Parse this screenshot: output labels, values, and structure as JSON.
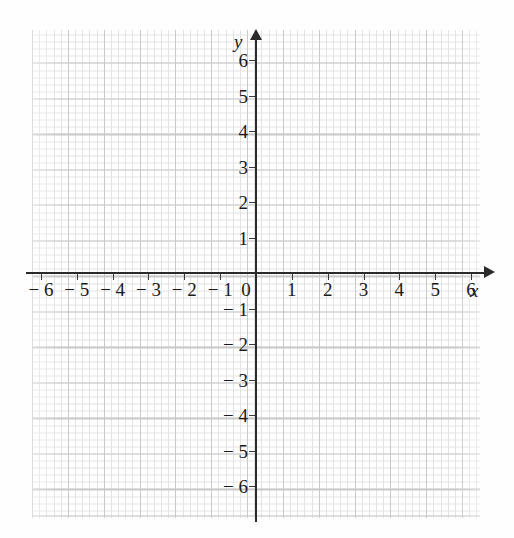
{
  "figure": {
    "kind": "cartesian-coordinate-grid",
    "background_color": "#fefefe",
    "grid_color_minor": "#e3e3e3",
    "grid_color_major": "#c9c9c9",
    "axis_color": "#2b2b2b",
    "label_color": "#1a1a1a"
  },
  "axes": {
    "x_axis_name": "x",
    "y_axis_name": "y",
    "origin_label": "0"
  },
  "chart_data": {
    "type": "scatter",
    "title": "",
    "subtitle": "",
    "xlabel": "x",
    "ylabel": "y",
    "xlim": [
      -6.25,
      6.25
    ],
    "ylim": [
      -6.85,
      6.85
    ],
    "grid": true,
    "minor_grid": true,
    "minor_ticks_per_unit": 5,
    "legend": false,
    "legend_position": "none",
    "x_ticks": [
      -6,
      -5,
      -4,
      -3,
      -2,
      -1,
      0,
      1,
      2,
      3,
      4,
      5,
      6
    ],
    "y_ticks": [
      -6,
      -5,
      -4,
      -3,
      -2,
      -1,
      1,
      2,
      3,
      4,
      5,
      6
    ],
    "x_tick_labels": [
      "− 6",
      "− 5",
      "− 4",
      "− 3",
      "− 2",
      "− 1",
      "0",
      "1",
      "2",
      "3",
      "4",
      "5",
      "6"
    ],
    "y_tick_labels": [
      "− 6",
      "− 5",
      "− 4",
      "− 3",
      "− 2",
      "− 1",
      "1",
      "2",
      "3",
      "4",
      "5",
      "6"
    ],
    "series": [],
    "annotations": [],
    "x": [],
    "values": []
  }
}
